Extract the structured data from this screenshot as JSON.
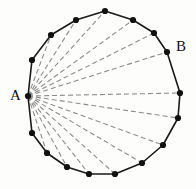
{
  "figure": {
    "type": "geometry-diagram",
    "width": 196,
    "height": 189,
    "background_color": "#fdfdfc"
  },
  "chart_data": {
    "type": "scatter",
    "title": "",
    "xlabel": "",
    "ylabel": "",
    "grid": false,
    "legend": null,
    "xlim": [
      0,
      196
    ],
    "ylim": [
      0,
      189
    ],
    "polygon": {
      "sides": 17,
      "vertex_count": 17,
      "outline_color": "#1a1a1a",
      "outline_width": 1.6,
      "vertex_marker": "filled-circle",
      "vertex_marker_color": "#111111",
      "vertex_marker_radius": 3.1,
      "vertices": [
        {
          "id": "A",
          "x": 28,
          "y": 96,
          "labeled": true
        },
        {
          "id": "v1",
          "x": 32,
          "y": 60,
          "labeled": false
        },
        {
          "id": "v2",
          "x": 51,
          "y": 35,
          "labeled": false
        },
        {
          "id": "v3",
          "x": 76,
          "y": 20,
          "labeled": false
        },
        {
          "id": "v4",
          "x": 105,
          "y": 11,
          "labeled": false
        },
        {
          "id": "v5",
          "x": 133,
          "y": 20,
          "labeled": false
        },
        {
          "id": "v6",
          "x": 154,
          "y": 33,
          "labeled": false
        },
        {
          "id": "B",
          "x": 167,
          "y": 52,
          "labeled": true
        },
        {
          "id": "v8",
          "x": 180,
          "y": 93,
          "labeled": false
        },
        {
          "id": "v9",
          "x": 178,
          "y": 118,
          "labeled": false
        },
        {
          "id": "v10",
          "x": 163,
          "y": 145,
          "labeled": false
        },
        {
          "id": "v11",
          "x": 142,
          "y": 163,
          "labeled": false
        },
        {
          "id": "v12",
          "x": 115,
          "y": 174,
          "labeled": false
        },
        {
          "id": "v13",
          "x": 89,
          "y": 174,
          "labeled": false
        },
        {
          "id": "v14",
          "x": 67,
          "y": 167,
          "labeled": false
        },
        {
          "id": "v15",
          "x": 47,
          "y": 153,
          "labeled": false
        },
        {
          "id": "v16",
          "x": 32,
          "y": 133,
          "labeled": false
        }
      ]
    },
    "diagonals": {
      "from_vertex": "A",
      "count": 14,
      "style": "dashed",
      "color": "#8c8c8c",
      "width": 1.1,
      "dash_pattern": "5,3",
      "to_vertices": [
        "v2",
        "v3",
        "v4",
        "v5",
        "v6",
        "B",
        "v8",
        "v9",
        "v10",
        "v11",
        "v12",
        "v13",
        "v14",
        "v15"
      ]
    },
    "labels": [
      {
        "text": "A",
        "x": 10,
        "y": 88,
        "vertex": "A",
        "font_size": 15
      },
      {
        "text": "B",
        "x": 176,
        "y": 39,
        "vertex": "B",
        "font_size": 15
      }
    ]
  }
}
